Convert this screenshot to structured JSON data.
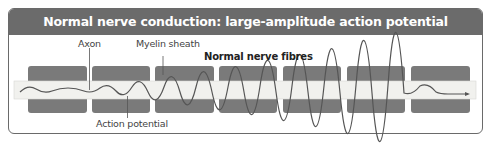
{
  "title": "Normal nerve conduction: large-amplitude action potential",
  "labels": {
    "axon": "Axon",
    "myelin_sheath": "Myelin sheath",
    "fibre_type": "Normal nerve fibres",
    "action_potential": "Action potential"
  },
  "diagram": {
    "myelin_segments": 7,
    "colors": {
      "header_bg": "#6b6b6b",
      "myelin": "#7a7a7a",
      "axon_band": "#f1f1ee",
      "wave": "#555555"
    }
  }
}
